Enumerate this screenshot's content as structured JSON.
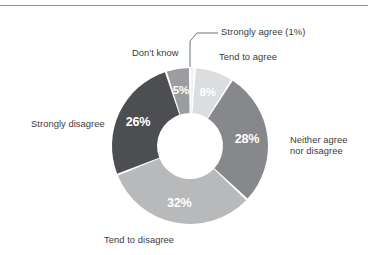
{
  "figure": {
    "background_color": "#ffffff",
    "rule_color": "#8d9096",
    "label_color": "#3b3b3d",
    "value_label_color": "#ffffff",
    "leader_line_color": "#6e7176"
  },
  "chart_data": {
    "type": "pie",
    "variant": "donut",
    "title": "",
    "xlabel": "",
    "ylabel": "",
    "legend_position": "none",
    "grid": false,
    "units": "percent",
    "total": 100,
    "center": {
      "x": 190,
      "y": 146
    },
    "outer_radius": 78,
    "inner_radius": 33,
    "start_angle_deg": -90,
    "direction": "clockwise",
    "gap_deg": 1.6,
    "categories": [
      "Strongly agree",
      "Tend to agree",
      "Neither agree nor disagree",
      "Tend to disagree",
      "Strongly disagree",
      "Don't know"
    ],
    "values": [
      1,
      8,
      28,
      32,
      26,
      5
    ],
    "slices": [
      {
        "label": "Strongly agree",
        "value": 1,
        "value_label": "1%",
        "callout_label": "Strongly agree (1%)",
        "value_label_inside": false,
        "color": "#f0f1f2",
        "has_leader_line": true
      },
      {
        "label": "Tend to agree",
        "value": 8,
        "value_label": "8%",
        "value_label_inside": true,
        "color": "#dcdddf",
        "has_leader_line": false
      },
      {
        "label": "Neither agree nor disagree",
        "value": 28,
        "value_label": "28%",
        "value_label_inside": true,
        "color": "#86888b",
        "has_leader_line": false
      },
      {
        "label": "Tend to disagree",
        "value": 32,
        "value_label": "32%",
        "value_label_inside": true,
        "color": "#b7b9bb",
        "has_leader_line": false
      },
      {
        "label": "Strongly disagree",
        "value": 26,
        "value_label": "26%",
        "value_label_inside": true,
        "color": "#4c4e52",
        "has_leader_line": false
      },
      {
        "label": "Don't know",
        "value": 5,
        "value_label": "5%",
        "value_label_inside": true,
        "color": "#9b9da0",
        "has_leader_line": false
      }
    ],
    "external_labels": [
      {
        "text": "Strongly agree (1%)",
        "lines": [
          "Strongly agree (1%)"
        ]
      },
      {
        "text": "Tend to agree",
        "lines": [
          "Tend to agree"
        ]
      },
      {
        "text": "Don't know",
        "lines": [
          "Don't know"
        ]
      },
      {
        "text": "Strongly disagree",
        "lines": [
          "Strongly disagree"
        ]
      },
      {
        "text": "Neither agree nor disagree",
        "lines": [
          "Neither agree",
          "nor disagree"
        ]
      },
      {
        "text": "Tend to disagree",
        "lines": [
          "Tend to disagree"
        ]
      }
    ],
    "value_labels": [
      "1%",
      "8%",
      "28%",
      "32%",
      "26%",
      "5%"
    ]
  },
  "labels": {
    "strongly_agree_callout": "Strongly agree (1%)",
    "tend_to_agree": "Tend to agree",
    "dont_know": "Don't know",
    "strongly_disagree": "Strongly disagree",
    "neither_line1": "Neither agree",
    "neither_line2": "nor disagree",
    "tend_to_disagree": "Tend to disagree"
  },
  "values": {
    "tend_to_agree_pct": "8%",
    "neither_pct": "28%",
    "tend_to_disagree_pct": "32%",
    "strongly_disagree_pct": "26%",
    "dont_know_pct": "5%"
  }
}
